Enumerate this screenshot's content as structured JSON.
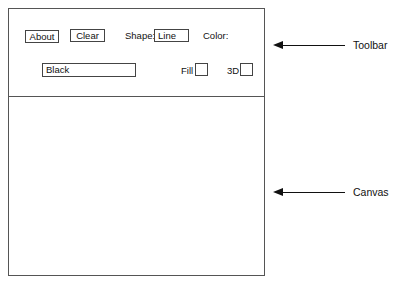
{
  "toolbar": {
    "about_label": "About",
    "clear_label": "Clear",
    "shape_label": "Shape:",
    "shape_value": "Line",
    "color_label": "Color:",
    "color_value": "Black",
    "fill_label": "Fill",
    "threed_label": "3D"
  },
  "callouts": {
    "toolbar": "Toolbar",
    "canvas": "Canvas"
  }
}
